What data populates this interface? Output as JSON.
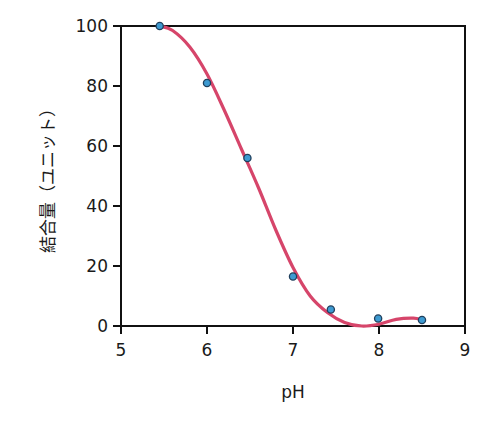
{
  "chart_data": {
    "type": "scatter",
    "title": "",
    "xlabel": "pH",
    "ylabel": "結合量（ユニット）",
    "xlim": [
      5,
      9
    ],
    "ylim": [
      0,
      100
    ],
    "x_ticks": [
      5,
      6,
      7,
      8,
      9
    ],
    "y_ticks": [
      0,
      20,
      40,
      60,
      80,
      100
    ],
    "grid": false,
    "legend": null,
    "series": [
      {
        "name": "measured",
        "kind": "scatter",
        "color": "#3d9ad1",
        "edge_color": "#1f3f5c",
        "x": [
          5.45,
          6.0,
          6.47,
          7.0,
          7.44,
          7.99,
          8.5
        ],
        "y": [
          100,
          81,
          56,
          16.5,
          5.5,
          2.5,
          2
        ]
      },
      {
        "name": "fit",
        "kind": "line",
        "color": "#d6456a",
        "x": [
          5.45,
          5.6,
          5.8,
          6.0,
          6.2,
          6.4,
          6.6,
          6.8,
          7.0,
          7.2,
          7.4,
          7.6,
          7.8,
          8.0,
          8.2,
          8.4,
          8.5
        ],
        "y": [
          100,
          98.5,
          93,
          84,
          72,
          59,
          46,
          32,
          19.5,
          10,
          4.5,
          1.2,
          0,
          0.6,
          2.2,
          2.6,
          2
        ]
      }
    ]
  },
  "axes": {
    "x_tick_labels": [
      "5",
      "6",
      "7",
      "8",
      "9"
    ],
    "y_tick_labels": [
      "0",
      "20",
      "40",
      "60",
      "80",
      "100"
    ],
    "x_title": "pH",
    "y_title": "結合量（ユニット）"
  }
}
